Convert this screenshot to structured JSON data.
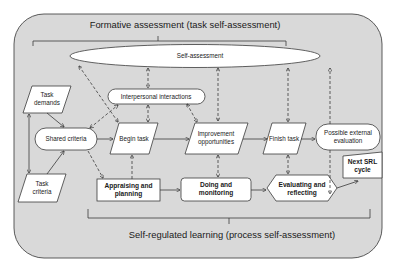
{
  "diagram": {
    "colors": {
      "container_fill": "#d9d9d9",
      "container_stroke": "#4a4a4a",
      "node_fill": "#ffffff",
      "node_stroke": "#3a3a3a",
      "line": "#3a3a3a",
      "text": "#1a1a1a",
      "page_bg": "#ffffff"
    },
    "top_caption": "Formative assessment (task self-assessment)",
    "bottom_caption": "Self-regulated learning (process self-assessment)",
    "nodes": {
      "self_assessment": {
        "label": "Self-assessment",
        "shape": "ellipse"
      },
      "interpersonal": {
        "label": "Interpersonal interactions",
        "shape": "pill"
      },
      "task_demands": {
        "line1": "Task",
        "line2": "demands",
        "shape": "parallelogram"
      },
      "shared_criteria": {
        "label": "Shared criteria",
        "shape": "pill"
      },
      "task_criteria": {
        "line1": "Task",
        "line2": "criteria",
        "shape": "parallelogram"
      },
      "begin_task": {
        "label": "Begin task",
        "shape": "parallelogram"
      },
      "improvement": {
        "line1": "Improvement",
        "line2": "opportunities",
        "shape": "parallelogram"
      },
      "finish_task": {
        "label": "Finish task",
        "shape": "parallelogram"
      },
      "external_eval": {
        "line1": "Possible external",
        "line2": "evaluation",
        "shape": "pill"
      },
      "appraising": {
        "line1": "Appraising and",
        "line2": "planning",
        "shape": "rectangle"
      },
      "doing": {
        "line1": "Doing and",
        "line2": "monitoring",
        "shape": "rounded-rectangle"
      },
      "evaluating": {
        "line1": "Evaluating and",
        "line2": "reflecting",
        "shape": "hexagon"
      },
      "next_cycle": {
        "line1": "Next SRL",
        "line2": "cycle",
        "shape": "manual-input"
      }
    },
    "edges": [
      {
        "from": "task_demands",
        "to": "shared_criteria",
        "style": "solid"
      },
      {
        "from": "task_criteria",
        "to": "shared_criteria",
        "style": "solid"
      },
      {
        "from": "task_demands",
        "to": "task_criteria",
        "style": "solid",
        "bidirectional": true
      },
      {
        "from": "shared_criteria",
        "to": "begin_task",
        "style": "solid"
      },
      {
        "from": "begin_task",
        "to": "improvement",
        "style": "solid"
      },
      {
        "from": "improvement",
        "to": "finish_task",
        "style": "solid"
      },
      {
        "from": "finish_task",
        "to": "external_eval",
        "style": "solid"
      },
      {
        "from": "appraising",
        "to": "doing",
        "style": "solid"
      },
      {
        "from": "doing",
        "to": "evaluating",
        "style": "solid"
      },
      {
        "from": "evaluating",
        "to": "next_cycle",
        "style": "solid"
      },
      {
        "from": "self_assessment",
        "to": "interpersonal",
        "style": "dashed",
        "bidirectional": true
      },
      {
        "from": "self_assessment",
        "to": "improvement",
        "style": "dashed",
        "bidirectional": true
      },
      {
        "from": "self_assessment",
        "to": "finish_task",
        "style": "dashed",
        "bidirectional": true
      },
      {
        "from": "self_assessment",
        "to": "appraising",
        "style": "dashed",
        "bidirectional": true
      },
      {
        "from": "external_eval",
        "to": "self_assessment",
        "style": "dashed"
      },
      {
        "from": "external_eval",
        "to": "evaluating",
        "style": "dashed"
      },
      {
        "from": "interpersonal",
        "to": "begin_task",
        "style": "dashed",
        "bidirectional": true
      },
      {
        "from": "interpersonal",
        "to": "improvement",
        "style": "dashed",
        "bidirectional": true
      },
      {
        "from": "shared_criteria",
        "to": "interpersonal",
        "style": "dashed",
        "bidirectional": true
      },
      {
        "from": "shared_criteria",
        "to": "appraising",
        "style": "dashed"
      },
      {
        "from": "appraising",
        "to": "begin_task",
        "style": "dashed"
      },
      {
        "from": "improvement",
        "to": "doing",
        "style": "dashed",
        "bidirectional": true
      },
      {
        "from": "finish_task",
        "to": "evaluating",
        "style": "dashed",
        "bidirectional": true
      }
    ]
  }
}
